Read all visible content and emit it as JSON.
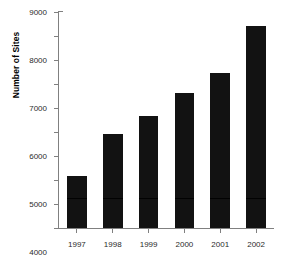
{
  "chart_data": {
    "type": "bar",
    "title": "",
    "xlabel": "",
    "ylabel": "Number of Sites",
    "categories": [
      "1997",
      "1998",
      "1999",
      "2000",
      "2001",
      "2002"
    ],
    "values": [
      2180,
      3920,
      4680,
      5620,
      6450,
      8400
    ],
    "ylim": [
      0,
      9000
    ],
    "yticks": [
      0,
      1000,
      2000,
      3000,
      4000,
      5000,
      6000,
      7000,
      8000,
      9000
    ],
    "ytick_labels": [
      "0",
      "1000",
      "2000",
      "3000",
      "4000",
      "5000",
      "6000",
      "7000",
      "8000",
      "9000"
    ],
    "grid": false,
    "legend": null,
    "bar_color": "#121212",
    "axis_color": "#808080"
  }
}
